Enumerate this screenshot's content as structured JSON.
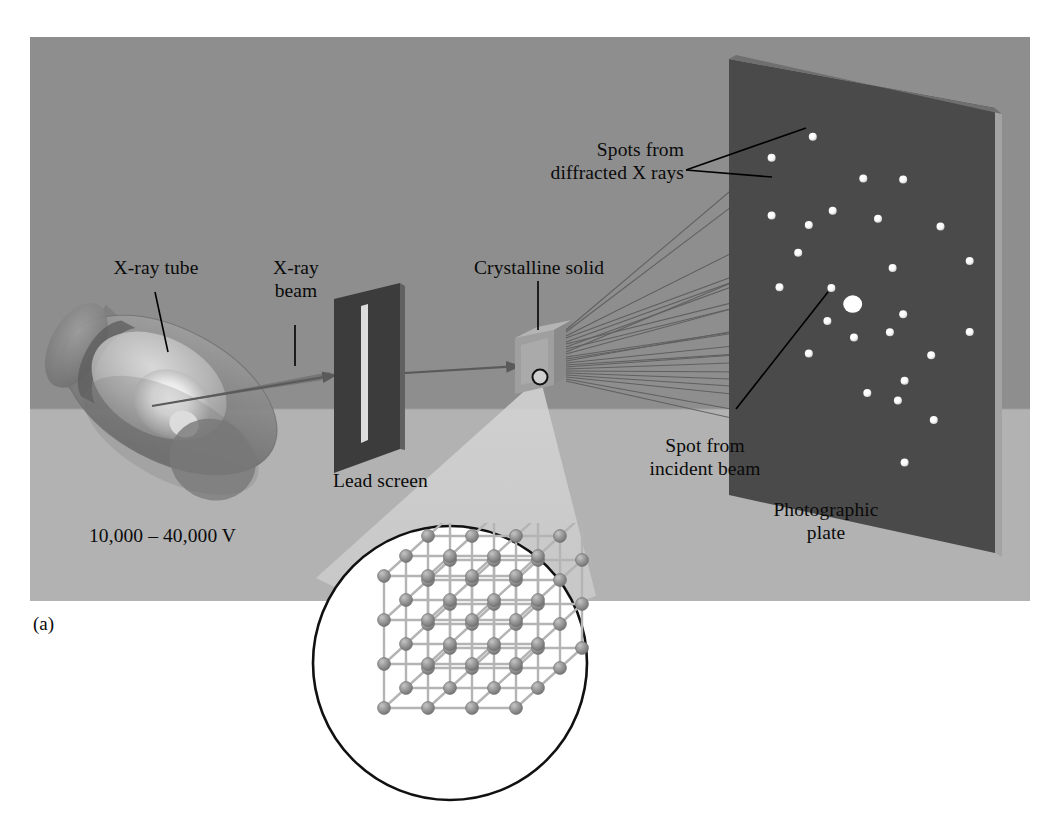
{
  "figure": {
    "panel_letter": "(a)",
    "domain_kind": "scientific-diagram"
  },
  "labels": {
    "xray_tube": "X-ray tube",
    "xray_beam_line1": "X-ray",
    "xray_beam_line2": "beam",
    "voltage": "10,000 – 40,000 V",
    "lead_screen": "Lead screen",
    "crystalline_solid": "Crystalline solid",
    "spots_diffracted_line1": "Spots from",
    "spots_diffracted_line2": "diffracted X rays",
    "spot_incident_line1": "Spot from",
    "spot_incident_line2": "incident beam",
    "photographic_plate_line1": "Photographic",
    "photographic_plate_line2": "plate"
  },
  "colors": {
    "background_page": "#ffffff",
    "scene_wall": "#8e8e8e",
    "scene_floor": "#b2b2b2",
    "plate_face": "#4a4a4a",
    "plate_edge": "#a9a9a9",
    "lead_screen": "#3c3c3c",
    "slit": "#d8d8d8",
    "tube_glass": "#8a8a8a",
    "tube_highlight": "#e8e8e8",
    "crystal_cube": "#9b9b9b",
    "spot_white": "#ffffff",
    "ray_line": "#555555",
    "leader_line": "#000000",
    "lattice_sphere": "#8b8b8b",
    "lattice_rod": "#b4b4b4",
    "inset_circle_stroke": "#111111",
    "inset_circle_fill": "#ffffff",
    "cone_light": "#c9c9c9",
    "text": "#0a0a0a"
  },
  "scene": {
    "wall": {
      "x": 30,
      "y": 37,
      "width": 1000,
      "height": 372
    },
    "floor": {
      "x": 30,
      "y": 409,
      "width": 1000,
      "height": 192
    },
    "horizon_y": 409
  },
  "components": {
    "xray_tube": {
      "center_x": 160,
      "center_y": 395,
      "description": "translucent tilted cylindrical evacuated tube with internal target and glowing filament"
    },
    "lead_screen": {
      "x": 332,
      "y": 295,
      "width": 68,
      "height": 178,
      "slit_width": 7,
      "description": "dark lead plate with a narrow vertical collimating slit"
    },
    "crystal": {
      "x": 515,
      "y": 330,
      "size": 50,
      "description": "small grey cube representing the crystalline sample"
    },
    "photographic_plate": {
      "x": 725,
      "y": 60,
      "width": 270,
      "height": 490,
      "description": "large dark photographic plate tilted in perspective, carrying the diffraction spot pattern"
    },
    "lattice_inset": {
      "center_x": 450,
      "center_y": 663,
      "radius": 140,
      "grid": 3,
      "description": "circular magnified inset showing a simple cubic 3x3x3 lattice of atoms connected by bonds"
    }
  },
  "chart_data": {
    "type": "scatter",
    "xlabel": "",
    "ylabel": "",
    "legend": [],
    "note": "Bright spots recorded on the photographic plate; u,v are normalized plate coordinates (0-1, origin top-left of plate face). The large central spot is the undiffracted incident beam.",
    "central_spot": {
      "u": 0.465,
      "v": 0.505,
      "r": 9.5,
      "kind": "incident-beam"
    },
    "spots": [
      {
        "u": 0.315,
        "v": 0.142,
        "r": 4.0
      },
      {
        "u": 0.16,
        "v": 0.208,
        "r": 4.0
      },
      {
        "u": 0.505,
        "v": 0.215,
        "r": 4.0
      },
      {
        "u": 0.655,
        "v": 0.2,
        "r": 4.0
      },
      {
        "u": 0.795,
        "v": 0.29,
        "r": 4.0
      },
      {
        "u": 0.39,
        "v": 0.302,
        "r": 4.0
      },
      {
        "u": 0.56,
        "v": 0.3,
        "r": 4.0
      },
      {
        "u": 0.16,
        "v": 0.34,
        "r": 4.0
      },
      {
        "u": 0.3,
        "v": 0.345,
        "r": 4.0
      },
      {
        "u": 0.905,
        "v": 0.355,
        "r": 4.0
      },
      {
        "u": 0.26,
        "v": 0.413,
        "r": 4.0
      },
      {
        "u": 0.615,
        "v": 0.405,
        "r": 4.0
      },
      {
        "u": 0.385,
        "v": 0.478,
        "r": 4.0
      },
      {
        "u": 0.19,
        "v": 0.5,
        "r": 4.0
      },
      {
        "u": 0.655,
        "v": 0.505,
        "r": 4.0
      },
      {
        "u": 0.905,
        "v": 0.515,
        "r": 4.0
      },
      {
        "u": 0.37,
        "v": 0.555,
        "r": 4.0
      },
      {
        "u": 0.605,
        "v": 0.552,
        "r": 4.0
      },
      {
        "u": 0.47,
        "v": 0.58,
        "r": 4.0
      },
      {
        "u": 0.76,
        "v": 0.585,
        "r": 4.0
      },
      {
        "u": 0.3,
        "v": 0.638,
        "r": 4.0
      },
      {
        "u": 0.66,
        "v": 0.655,
        "r": 4.0
      },
      {
        "u": 0.52,
        "v": 0.7,
        "r": 4.0
      },
      {
        "u": 0.635,
        "v": 0.703,
        "r": 4.0
      },
      {
        "u": 0.77,
        "v": 0.73,
        "r": 4.0
      },
      {
        "u": 0.66,
        "v": 0.84,
        "r": 4.0
      }
    ],
    "diffracted_rays_count": 22
  }
}
